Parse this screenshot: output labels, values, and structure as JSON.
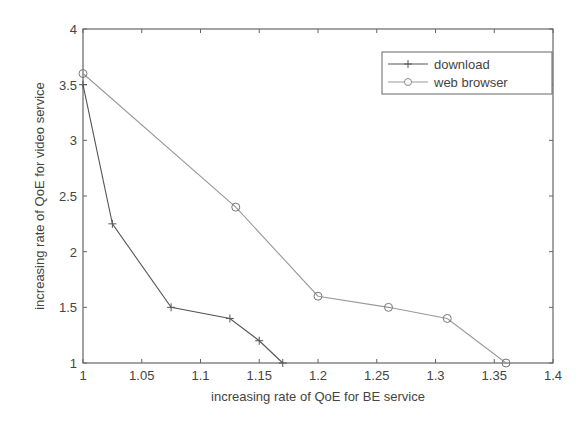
{
  "chart_data": {
    "type": "line",
    "title": "",
    "xlabel": "increasing rate of QoE for BE service",
    "ylabel": "increasing rate of QoE for video service",
    "xlim": [
      1,
      1.4
    ],
    "ylim": [
      1,
      4
    ],
    "xticks": [
      "1",
      "1.05",
      "1.1",
      "1.15",
      "1.2",
      "1.25",
      "1.3",
      "1.35",
      "1.4"
    ],
    "yticks": [
      "1",
      "1.5",
      "2",
      "2.5",
      "3",
      "3.5",
      "4"
    ],
    "grid": false,
    "legend_position": "upper right",
    "series": [
      {
        "name": "download",
        "marker": "+",
        "color": "#555555",
        "x": [
          1.0,
          1.025,
          1.075,
          1.125,
          1.15,
          1.17
        ],
        "y": [
          3.5,
          2.25,
          1.5,
          1.4,
          1.2,
          1.0
        ]
      },
      {
        "name": "web browser",
        "marker": "o",
        "color": "#999999",
        "x": [
          1.0,
          1.13,
          1.2,
          1.26,
          1.31,
          1.36
        ],
        "y": [
          3.6,
          2.4,
          1.6,
          1.5,
          1.4,
          1.0
        ]
      }
    ]
  },
  "legend": {
    "items": [
      {
        "label": "download"
      },
      {
        "label": "web browser"
      }
    ]
  },
  "axes": {
    "xlabel": "increasing rate of QoE for BE service",
    "ylabel": "increasing rate of QoE for video service"
  }
}
